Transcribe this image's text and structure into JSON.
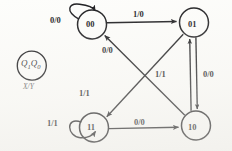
{
  "diagram": {
    "type": "mealy-state-transition-diagram",
    "legend": {
      "state_encoding": "Q1Q0",
      "state_encoding_q": "Q",
      "state_encoding_sub1": "1",
      "state_encoding_q2": "Q",
      "state_encoding_sub0": "0",
      "transition_format": "X/Y"
    },
    "states": [
      {
        "id": "s00",
        "label": "00",
        "cx": 93,
        "cy": 24
      },
      {
        "id": "s01",
        "label": "01",
        "cx": 195,
        "cy": 24
      },
      {
        "id": "s11",
        "label": "11",
        "cx": 93,
        "cy": 127
      },
      {
        "id": "s10",
        "label": "10",
        "cx": 195,
        "cy": 127
      }
    ],
    "transitions": [
      {
        "from": "00",
        "to": "00",
        "label": "0/0",
        "kind": "self-loop",
        "side": "left"
      },
      {
        "from": "00",
        "to": "01",
        "label": "1/0",
        "kind": "straight",
        "side": "top"
      },
      {
        "from": "01",
        "to": "11",
        "label": "1/1",
        "kind": "diagonal",
        "side": "down-left"
      },
      {
        "from": "01",
        "to": "10",
        "label": "0/0",
        "kind": "vertical",
        "side": "right"
      },
      {
        "from": "10",
        "to": "01",
        "label": "1/1",
        "kind": "vertical",
        "side": "left"
      },
      {
        "from": "10",
        "to": "00",
        "label": "0/0",
        "kind": "diagonal",
        "side": "up-left"
      },
      {
        "from": "11",
        "to": "11",
        "label": "1/1",
        "kind": "self-loop",
        "side": "left"
      },
      {
        "from": "11",
        "to": "10",
        "label": "0/0",
        "kind": "straight",
        "side": "bottom"
      }
    ],
    "labels": {
      "self_00": "0/0",
      "top_00_to_01": "1/0",
      "diag_10_to_00": "0/0",
      "diag_01_to_11": "1/1",
      "vert_10_to_01": "1/1",
      "vert_01_to_10": "0/0",
      "self_11": "1/1",
      "bottom_11_to_10": "0/0"
    },
    "colors": {
      "stroke": "#1a1a1d",
      "text": "#111114",
      "background": "#fdfdfb"
    }
  }
}
